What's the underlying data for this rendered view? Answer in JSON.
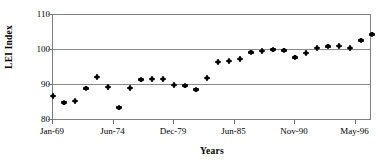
{
  "chart_data": {
    "type": "scatter",
    "title": "",
    "xlabel": "Years",
    "ylabel": "LEI Index",
    "ylim": [
      80,
      110
    ],
    "yticks": [
      80,
      90,
      100,
      110
    ],
    "grid": true,
    "legend": "none",
    "xtick_labels": [
      "Jan-69",
      "Jun-74",
      "Dec-79",
      "Jun-85",
      "Nov-90",
      "May-96"
    ],
    "xtick_positions": [
      0,
      5.5,
      11,
      16.5,
      22,
      27.5
    ],
    "x": [
      0,
      1,
      2,
      3,
      4,
      5,
      6,
      7,
      8,
      9,
      10,
      11,
      12,
      13,
      14,
      15,
      16,
      17,
      18,
      19,
      20,
      21,
      22,
      23,
      24,
      25,
      26,
      27,
      28
    ],
    "values": [
      87.1,
      85.2,
      85.6,
      89.2,
      92.4,
      89.7,
      83.8,
      89.3,
      91.7,
      91.9,
      91.9,
      90.2,
      90.0,
      88.9,
      92.1,
      96.7,
      96.9,
      97.5,
      99.4,
      99.8,
      100.2,
      100.0,
      98.0,
      99.3,
      100.7,
      101.1,
      101.3,
      100.6,
      102.8
    ],
    "last_value": 104.5,
    "marker": "filled-diamond",
    "marker_color": "#000000"
  },
  "axes": {
    "y_title": "LEI Index",
    "x_title": "Years",
    "y_tick_110": "110",
    "y_tick_100": "100",
    "y_tick_90": "90",
    "y_tick_80": "80",
    "x_tick_0": "Jan-69",
    "x_tick_1": "Jun-74",
    "x_tick_2": "Dec-79",
    "x_tick_3": "Jun-85",
    "x_tick_4": "Nov-90",
    "x_tick_5": "May-96"
  },
  "colors": {
    "frame": "#808080",
    "grid": "#8a8a8a",
    "marker": "#000000",
    "background": "#ffffff"
  }
}
